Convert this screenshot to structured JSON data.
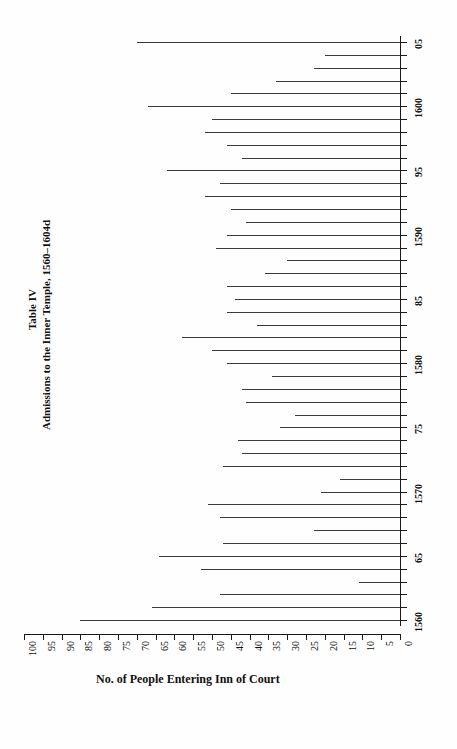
{
  "figure": {
    "table_number": "Table IV",
    "caption": "Admissions to the Inner Temple, 1560–1604d",
    "value_axis_title": "No. of People Entering Inn of Court"
  },
  "chart_data": {
    "type": "bar",
    "orientation": "horizontal-rotated",
    "title": "Table IV",
    "subtitle": "Admissions to the Inner Temple, 1560–1604d",
    "xlabel": "No. of People Entering Inn of Court",
    "ylabel": "",
    "xlim": [
      0,
      100
    ],
    "ylim": [
      "1560",
      "1605"
    ],
    "grid": false,
    "legend": null,
    "value_ticks": [
      100,
      95,
      90,
      85,
      80,
      75,
      70,
      65,
      60,
      55,
      50,
      45,
      40,
      35,
      30,
      25,
      20,
      15,
      10,
      5,
      0
    ],
    "value_tick_labels": [
      "100",
      "95",
      "90",
      "85",
      "80",
      "75",
      "70",
      "65",
      "60",
      "55",
      "50",
      "45",
      "40",
      "35",
      "30",
      "25",
      "20",
      "15",
      "10",
      "5",
      "0"
    ],
    "category_tick_labels": [
      "1560",
      "65",
      "1570",
      "75",
      "1580",
      "85",
      "1590",
      "95",
      "1600",
      "05"
    ],
    "categories": [
      "1560",
      "1561",
      "1562",
      "1563",
      "1564",
      "1565",
      "1566",
      "1567",
      "1568",
      "1569",
      "1570",
      "1571",
      "1572",
      "1573",
      "1574",
      "1575",
      "1576",
      "1577",
      "1578",
      "1579",
      "1580",
      "1581",
      "1582",
      "1583",
      "1584",
      "1585",
      "1586",
      "1587",
      "1588",
      "1589",
      "1590",
      "1591",
      "1592",
      "1593",
      "1594",
      "1595",
      "1596",
      "1597",
      "1598",
      "1599",
      "1600",
      "1601",
      "1602",
      "1603",
      "1604",
      "1605"
    ],
    "values": [
      85,
      66,
      48,
      11,
      53,
      64,
      47,
      23,
      48,
      51,
      21,
      16,
      47,
      42,
      43,
      32,
      28,
      41,
      42,
      34,
      46,
      50,
      58,
      38,
      46,
      44,
      46,
      36,
      30,
      49,
      46,
      41,
      45,
      52,
      48,
      62,
      42,
      46,
      52,
      50,
      67,
      45,
      33,
      23,
      20,
      70
    ],
    "bar_color": "#3a3a3a",
    "axis_color": "#1a1a1a",
    "background": "#ffffff"
  }
}
